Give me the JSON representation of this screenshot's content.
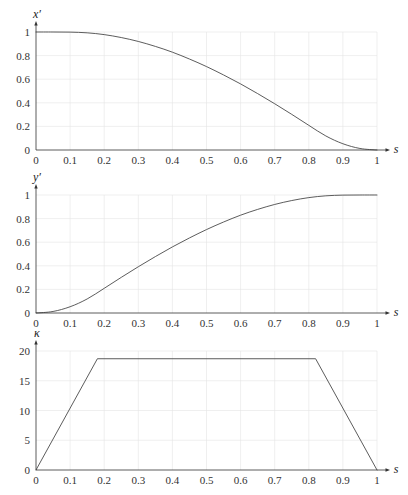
{
  "style": {
    "curve_color": "#4a4a4a",
    "grid_color": "#e4e4e4",
    "axis_color": "#333333",
    "background": "#ffffff"
  },
  "chart_data": [
    {
      "type": "line",
      "title": "",
      "xlabel": "s",
      "ylabel": "x′",
      "xlim": [
        0,
        1
      ],
      "ylim": [
        0,
        1
      ],
      "xticks": [
        0,
        0.1,
        0.2,
        0.3,
        0.4,
        0.5,
        0.6,
        0.7,
        0.8,
        0.9,
        1
      ],
      "xtick_labels": [
        "0",
        "0.1",
        "0.2",
        "0.3",
        "0.4",
        "0.5",
        "0.6",
        "0.7",
        "0.8",
        "0.9",
        "1"
      ],
      "yticks": [
        0,
        0.2,
        0.4,
        0.6,
        0.8,
        1
      ],
      "ytick_labels": [
        "0",
        "0.2",
        "0.4",
        "0.6",
        "0.8",
        "1"
      ],
      "grid": true,
      "legend": null,
      "series": [
        {
          "name": "x′(s)",
          "interpolation": "smooth",
          "x": [
            0,
            0.05,
            0.1,
            0.15,
            0.2,
            0.25,
            0.3,
            0.35,
            0.4,
            0.45,
            0.5,
            0.55,
            0.6,
            0.65,
            0.7,
            0.75,
            0.8,
            0.85,
            0.9,
            0.95,
            1
          ],
          "y": [
            1,
            1.0,
            0.999,
            0.993,
            0.978,
            0.953,
            0.92,
            0.878,
            0.829,
            0.771,
            0.707,
            0.636,
            0.56,
            0.478,
            0.392,
            0.302,
            0.209,
            0.119,
            0.053,
            0.013,
            0
          ]
        }
      ]
    },
    {
      "type": "line",
      "title": "",
      "xlabel": "s",
      "ylabel": "y′",
      "xlim": [
        0,
        1
      ],
      "ylim": [
        0,
        1
      ],
      "xticks": [
        0,
        0.1,
        0.2,
        0.3,
        0.4,
        0.5,
        0.6,
        0.7,
        0.8,
        0.9,
        1
      ],
      "xtick_labels": [
        "0",
        "0.1",
        "0.2",
        "0.3",
        "0.4",
        "0.5",
        "0.6",
        "0.7",
        "0.8",
        "0.9",
        "1"
      ],
      "yticks": [
        0,
        0.2,
        0.4,
        0.6,
        0.8,
        1
      ],
      "ytick_labels": [
        "0",
        "0.2",
        "0.4",
        "0.6",
        "0.8",
        "1"
      ],
      "grid": true,
      "legend": null,
      "series": [
        {
          "name": "y′(s)",
          "interpolation": "smooth",
          "x": [
            0,
            0.05,
            0.1,
            0.15,
            0.2,
            0.25,
            0.3,
            0.35,
            0.4,
            0.45,
            0.5,
            0.55,
            0.6,
            0.65,
            0.7,
            0.75,
            0.8,
            0.85,
            0.9,
            0.95,
            1
          ],
          "y": [
            0,
            0.013,
            0.053,
            0.119,
            0.209,
            0.302,
            0.392,
            0.478,
            0.56,
            0.636,
            0.707,
            0.771,
            0.829,
            0.878,
            0.92,
            0.953,
            0.978,
            0.993,
            0.999,
            1.0,
            1
          ]
        }
      ]
    },
    {
      "type": "line",
      "title": "",
      "xlabel": "s",
      "ylabel": "κ",
      "xlim": [
        0,
        1
      ],
      "ylim": [
        0,
        20
      ],
      "xticks": [
        0,
        0.1,
        0.2,
        0.3,
        0.4,
        0.5,
        0.6,
        0.7,
        0.8,
        0.9,
        1
      ],
      "xtick_labels": [
        "0",
        "0.1",
        "0.2",
        "0.3",
        "0.4",
        "0.5",
        "0.6",
        "0.7",
        "0.8",
        "0.9",
        "1"
      ],
      "yticks": [
        0,
        5,
        10,
        15,
        20
      ],
      "ytick_labels": [
        "0",
        "5",
        "10",
        "15",
        "20"
      ],
      "grid": true,
      "legend": null,
      "series": [
        {
          "name": "κ(s)",
          "interpolation": "linear",
          "x": [
            0,
            0.18,
            0.82,
            1
          ],
          "y": [
            0,
            18.7,
            18.7,
            0
          ]
        }
      ]
    }
  ]
}
